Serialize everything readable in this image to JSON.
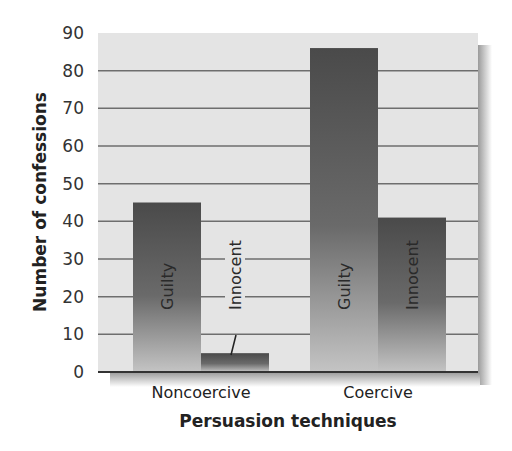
{
  "chart_data": {
    "type": "bar",
    "title": "",
    "xlabel": "Persuasion techniques",
    "ylabel": "Number of confessions",
    "categories": [
      "Noncoercive",
      "Coercive"
    ],
    "series": [
      {
        "name": "Guilty",
        "values": [
          45,
          86
        ]
      },
      {
        "name": "Innocent",
        "values": [
          5,
          41
        ]
      }
    ],
    "bar_labels": {
      "Noncoercive": [
        "Guilty",
        "Innocent"
      ],
      "Coercive": [
        "Guilty",
        "Innocent"
      ]
    },
    "yticks": [
      0,
      10,
      20,
      30,
      40,
      50,
      60,
      70,
      80,
      90
    ],
    "ylim": [
      0,
      90
    ],
    "grid": true,
    "legend": "none (labels drawn inside bars)",
    "colors": {
      "plot_background": "#e4e4e4",
      "bar_top": "#4a4a4a",
      "bar_bottom": "#bdbdbd",
      "gridline": "#6e6e6e",
      "axis": "#333333"
    }
  }
}
